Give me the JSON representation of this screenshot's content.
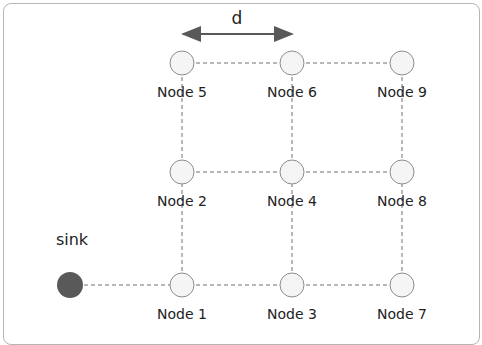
{
  "diagram": {
    "distance_label": "d",
    "sink": {
      "label": "sink",
      "x": 70,
      "y": 285,
      "color": "#595959"
    },
    "nodes": [
      {
        "id": 5,
        "label": "Node 5",
        "x": 182,
        "y": 63
      },
      {
        "id": 6,
        "label": "Node 6",
        "x": 292,
        "y": 63
      },
      {
        "id": 9,
        "label": "Node 9",
        "x": 402,
        "y": 63
      },
      {
        "id": 2,
        "label": "Node 2",
        "x": 182,
        "y": 172
      },
      {
        "id": 4,
        "label": "Node 4",
        "x": 292,
        "y": 172
      },
      {
        "id": 8,
        "label": "Node 8",
        "x": 402,
        "y": 172
      },
      {
        "id": 1,
        "label": "Node 1",
        "x": 182,
        "y": 285
      },
      {
        "id": 3,
        "label": "Node 3",
        "x": 292,
        "y": 285
      },
      {
        "id": 7,
        "label": "Node 7",
        "x": 402,
        "y": 285
      }
    ],
    "edges": [
      [
        "sink",
        1
      ],
      [
        1,
        3
      ],
      [
        3,
        7
      ],
      [
        2,
        4
      ],
      [
        4,
        8
      ],
      [
        5,
        6
      ],
      [
        6,
        9
      ],
      [
        1,
        2
      ],
      [
        2,
        5
      ],
      [
        3,
        4
      ],
      [
        4,
        6
      ],
      [
        7,
        8
      ],
      [
        8,
        9
      ]
    ],
    "colors": {
      "node_fill": "#f5f5f5",
      "node_stroke": "#8c8c8c",
      "edge": "#707070",
      "arrow": "#595959"
    }
  }
}
